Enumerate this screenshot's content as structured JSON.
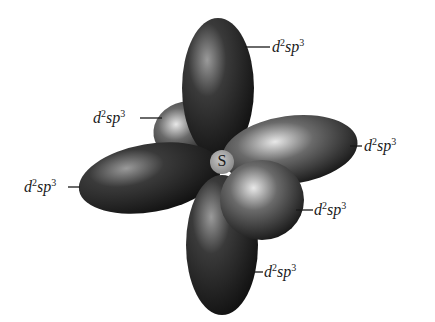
{
  "diagram": {
    "center_atom": "S",
    "hybridization_label": {
      "base": "d",
      "sup1": "2",
      "mid": "sp",
      "sup2": "3"
    },
    "lobes": [
      {
        "id": "top",
        "label": "d2sp3"
      },
      {
        "id": "upper-left-back",
        "label": "d2sp3"
      },
      {
        "id": "left",
        "label": "d2sp3"
      },
      {
        "id": "right",
        "label": "d2sp3"
      },
      {
        "id": "lower-right",
        "label": "d2sp3"
      },
      {
        "id": "bottom",
        "label": "d2sp3"
      }
    ]
  }
}
